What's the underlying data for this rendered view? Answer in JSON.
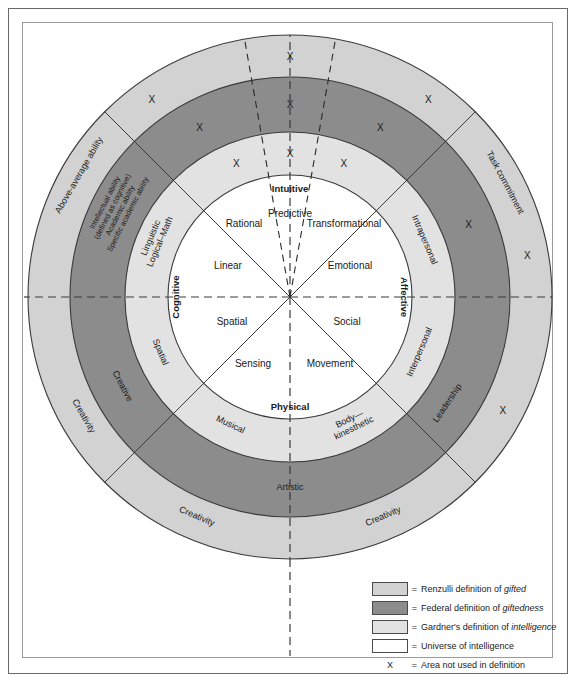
{
  "diagram": {
    "center": {
      "x": 290,
      "y": 297
    },
    "radii": {
      "outer": 262,
      "federal_outer": 220,
      "federal_inner": 165,
      "universe": 122
    },
    "colors": {
      "renzulli": "#d2d2d2",
      "federal": "#8c8c8c",
      "gardner": "#e2e2e2",
      "universe": "#ffffff",
      "stroke": "#3a3a3a",
      "text": "#1a1a1a"
    },
    "axis_labels": [
      {
        "id": "cognitive",
        "text": "Cognitive"
      },
      {
        "id": "affective",
        "text": "Affective"
      },
      {
        "id": "intuitive",
        "text": "Intuitive"
      },
      {
        "id": "physical",
        "text": "Physical"
      }
    ],
    "universe_segments": [
      {
        "id": "rational",
        "text": "Rational"
      },
      {
        "id": "predictive",
        "text": "Predictive"
      },
      {
        "id": "transformational",
        "text": "Transformational"
      },
      {
        "id": "linear",
        "text": "Linear"
      },
      {
        "id": "emotional",
        "text": "Emotional"
      },
      {
        "id": "spatial",
        "text": "Spatial"
      },
      {
        "id": "social",
        "text": "Social"
      },
      {
        "id": "sensing",
        "text": "Sensing"
      },
      {
        "id": "movement",
        "text": "Movement"
      }
    ],
    "gardner_ring": [
      {
        "id": "linguistic-logical-math",
        "line1": "Linguistic",
        "line2": "Logical–Math"
      },
      {
        "id": "intrapersonal",
        "text": "Intrapersonal"
      },
      {
        "id": "interpersonal",
        "text": "Interpersonal"
      },
      {
        "id": "spatial",
        "text": "Spatial"
      },
      {
        "id": "musical",
        "text": "Musical"
      },
      {
        "id": "body-kinesthetic",
        "line1": "Body—",
        "line2": "kinesthetic"
      }
    ],
    "federal_ring": [
      {
        "id": "intellectual-ability",
        "lines": [
          "Intellectual ability",
          "(defined as cognitive)",
          "Academic ability",
          "Specific academic ability"
        ]
      },
      {
        "id": "creative",
        "text": "Creative"
      },
      {
        "id": "artistic",
        "text": "Artistic"
      },
      {
        "id": "leadership",
        "text": "Leadership"
      }
    ],
    "renzulli_ring": [
      {
        "id": "above-average-ability",
        "text": "Above-average ability"
      },
      {
        "id": "task-commitment",
        "text": "Task commitment"
      },
      {
        "id": "creativity-left",
        "text": "Creativity"
      },
      {
        "id": "creativity-bottom-left",
        "text": "Creativity"
      },
      {
        "id": "creativity-bottom-right",
        "text": "Creativity"
      }
    ],
    "x_marks_label": "X",
    "x_marks": [
      {
        "ring": "renzulli",
        "angle_deg": -125
      },
      {
        "ring": "renzulli",
        "angle_deg": -90
      },
      {
        "ring": "renzulli",
        "angle_deg": -55
      },
      {
        "ring": "renzulli",
        "angle_deg": -10
      },
      {
        "ring": "renzulli",
        "angle_deg": 28
      },
      {
        "ring": "federal",
        "angle_deg": -118
      },
      {
        "ring": "federal",
        "angle_deg": -90
      },
      {
        "ring": "federal",
        "angle_deg": -62
      },
      {
        "ring": "federal",
        "angle_deg": -22
      },
      {
        "ring": "gardner",
        "angle_deg": -112
      },
      {
        "ring": "gardner",
        "angle_deg": -90
      },
      {
        "ring": "gardner",
        "angle_deg": -68
      }
    ]
  },
  "legend": {
    "items": [
      {
        "id": "renzulli",
        "swatch": "#d2d2d2",
        "eq": "=",
        "prefix": "Renzulli definition of ",
        "emphasis": "gifted",
        "suffix": ""
      },
      {
        "id": "federal",
        "swatch": "#8c8c8c",
        "eq": "=",
        "prefix": "Federal definition of ",
        "emphasis": "giftedness",
        "suffix": ""
      },
      {
        "id": "gardner",
        "swatch": "#e2e2e2",
        "eq": "=",
        "prefix": "Gardner's definition of ",
        "emphasis": "intelligence",
        "suffix": ""
      },
      {
        "id": "universe",
        "swatch": "#ffffff",
        "eq": "=",
        "prefix": "Universe of intelligence",
        "emphasis": "",
        "suffix": ""
      },
      {
        "id": "not-used",
        "swatch": null,
        "marker": "X",
        "eq": "=",
        "prefix": "Area not used in definition",
        "emphasis": "",
        "suffix": ""
      }
    ]
  }
}
